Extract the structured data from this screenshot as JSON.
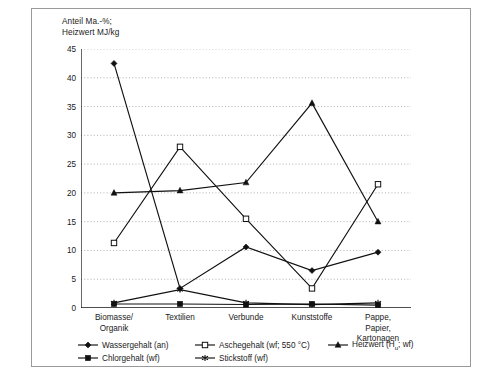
{
  "figure": {
    "axis_title": "Anteil Ma.-%;\nHeizwert MJ/kg"
  },
  "chart_data": {
    "type": "line",
    "title": "",
    "xlabel": "",
    "ylabel": "Anteil Ma.-%; Heizwert MJ/kg",
    "ylim": [
      0,
      45
    ],
    "ytick_step": 5,
    "yticks": [
      "0",
      "5",
      "10",
      "15",
      "20",
      "25",
      "30",
      "35",
      "40",
      "45"
    ],
    "grid": "horizontal-dotted",
    "legend_position": "below-axis",
    "categories": [
      "Biomasse/\nOrganik",
      "Textilien",
      "Verbunde",
      "Kunststoffe",
      "Pappe,\nPapier,\nKartonagen"
    ],
    "series": [
      {
        "name": "Wassergehalt (an)",
        "marker": "filled-diamond",
        "values": [
          42.5,
          3.4,
          10.6,
          6.5,
          9.7
        ]
      },
      {
        "name": "Aschegehalt (wf; 550 °C)",
        "marker": "open-square",
        "values": [
          11.3,
          28.0,
          15.5,
          3.4,
          21.5
        ]
      },
      {
        "name": "Heizwert (Hᵤ; wf)",
        "marker": "filled-triangle",
        "values": [
          20.0,
          20.4,
          21.8,
          35.6,
          15.0
        ]
      },
      {
        "name": "Chlorgehalt (wf)",
        "marker": "filled-square",
        "values": [
          0.7,
          0.7,
          0.6,
          0.7,
          0.5
        ]
      },
      {
        "name": "Stickstoff (wf)",
        "marker": "star",
        "values": [
          0.9,
          3.2,
          0.9,
          0.6,
          0.9
        ]
      }
    ]
  },
  "legend": {
    "items": [
      {
        "label": "Wassergehalt (an)",
        "marker": "filled-diamond"
      },
      {
        "label": "Aschegehalt (wf; 550 °C)",
        "marker": "open-square"
      },
      {
        "label": "Heizwert (H",
        "label_sub": "u",
        "label_tail": "; wf)",
        "marker": "filled-triangle"
      },
      {
        "label": "Chlorgehalt (wf)",
        "marker": "filled-square"
      },
      {
        "label": "Stickstoff (wf)",
        "marker": "star"
      }
    ]
  }
}
